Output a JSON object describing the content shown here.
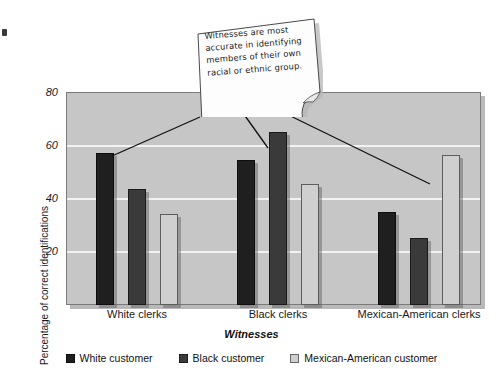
{
  "chart_data": {
    "type": "bar",
    "title": "",
    "xlabel": "Witnesses",
    "ylabel": "Percentage of correct identifications",
    "ylim": [
      0,
      80
    ],
    "yticks": [
      20,
      40,
      60,
      80
    ],
    "grid": true,
    "legend_position": "bottom",
    "categories": [
      "White clerks",
      "Black clerks",
      "Mexican-American clerks"
    ],
    "series": [
      {
        "name": "White customer",
        "color": "#1f1f1f",
        "values": [
          57,
          54.5,
          35
        ]
      },
      {
        "name": "Black customer",
        "color": "#3a3a3a",
        "values": [
          43.5,
          65,
          25
        ]
      },
      {
        "name": "Mexican-American customer",
        "color": "#cfcfcf",
        "values": [
          34,
          45.5,
          56.5
        ]
      }
    ],
    "annotations": [
      {
        "text": "Witnesses are most accurate in identifying members of their own racial or ethnic group.",
        "points_to": [
          "White clerks / White customer",
          "Black clerks / Black customer",
          "Mexican-American clerks / Mexican-American customer"
        ]
      }
    ]
  },
  "axes": {
    "y_tick_labels": [
      "80",
      "60",
      "40",
      "20"
    ],
    "y_axis_title": "Percentage of correct identifications",
    "x_tick_labels": [
      "White clerks",
      "Black clerks",
      "Mexican-American clerks"
    ],
    "x_axis_title": "Witnesses"
  },
  "legend": {
    "items": [
      {
        "label": "White customer",
        "color": "#1f1f1f"
      },
      {
        "label": "Black customer",
        "color": "#3a3a3a"
      },
      {
        "label": "Mexican-American customer",
        "color": "#cfcfcf"
      }
    ]
  },
  "callout": {
    "text": "Witnesses are most accurate in identifying members of their own racial or ethnic group."
  },
  "colors": {
    "plot_background": "#c6c6c6",
    "gridline": "#f2f2f2",
    "frame": "#7b7b7b",
    "note_background": "#fdfdfd",
    "leader_line": "#111111"
  }
}
